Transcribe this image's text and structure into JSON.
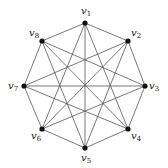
{
  "diagram": {
    "type": "graph",
    "vertices": [
      {
        "id": "v1",
        "label": "v",
        "sub": "1",
        "x": 85,
        "y": 23,
        "lx": 81,
        "ly": 14
      },
      {
        "id": "v2",
        "label": "v",
        "sub": "2",
        "x": 128,
        "y": 41,
        "lx": 131,
        "ly": 36
      },
      {
        "id": "v3",
        "label": "v",
        "sub": "3",
        "x": 145,
        "y": 86,
        "lx": 149,
        "ly": 89
      },
      {
        "id": "v4",
        "label": "v",
        "sub": "4",
        "x": 128,
        "y": 129,
        "lx": 131,
        "ly": 139
      },
      {
        "id": "v5",
        "label": "v",
        "sub": "5",
        "x": 85,
        "y": 148,
        "lx": 81,
        "ly": 161
      },
      {
        "id": "v6",
        "label": "v",
        "sub": "6",
        "x": 42,
        "y": 129,
        "lx": 31,
        "ly": 139
      },
      {
        "id": "v7",
        "label": "v",
        "sub": "7",
        "x": 24,
        "y": 86,
        "lx": 8,
        "ly": 89
      },
      {
        "id": "v8",
        "label": "v",
        "sub": "8",
        "x": 42,
        "y": 41,
        "lx": 29,
        "ly": 36
      }
    ],
    "edges": [
      [
        "v1",
        "v2"
      ],
      [
        "v2",
        "v3"
      ],
      [
        "v3",
        "v4"
      ],
      [
        "v4",
        "v5"
      ],
      [
        "v5",
        "v6"
      ],
      [
        "v6",
        "v7"
      ],
      [
        "v7",
        "v8"
      ],
      [
        "v8",
        "v1"
      ],
      [
        "v1",
        "v4"
      ],
      [
        "v2",
        "v5"
      ],
      [
        "v3",
        "v6"
      ],
      [
        "v4",
        "v7"
      ],
      [
        "v5",
        "v8"
      ],
      [
        "v6",
        "v1"
      ],
      [
        "v7",
        "v2"
      ],
      [
        "v8",
        "v3"
      ],
      [
        "v1",
        "v5"
      ],
      [
        "v2",
        "v6"
      ],
      [
        "v3",
        "v7"
      ],
      [
        "v4",
        "v8"
      ]
    ],
    "colors": {
      "edge": "#555555",
      "vertex": "#111111",
      "label": "#222222"
    }
  }
}
